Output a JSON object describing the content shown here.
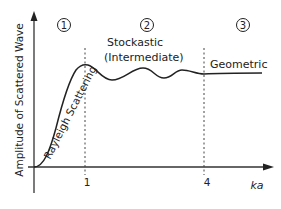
{
  "diagram": {
    "y_axis_label": "Amplitude of Scattered Wave",
    "x_axis_label": "ka",
    "ticks": [
      {
        "label": "1"
      },
      {
        "label": "4"
      }
    ],
    "regions": [
      {
        "number": "1",
        "name": "Rayleigh Scattering"
      },
      {
        "number": "2",
        "name_line1": "Stockastic",
        "name_line2": "(Intermediate)"
      },
      {
        "number": "3",
        "name": "Geometric"
      }
    ],
    "colors": {
      "line": "#222222",
      "background": "#ffffff"
    }
  }
}
